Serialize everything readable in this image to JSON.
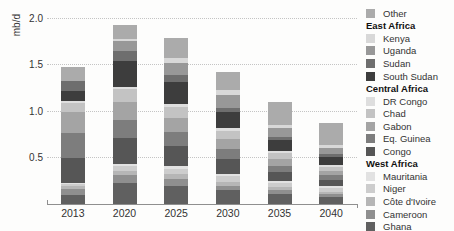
{
  "chart_data": {
    "type": "bar",
    "stacked": true,
    "title": "",
    "xlabel": "",
    "ylabel": "mb/d",
    "ylim": [
      0,
      2.0
    ],
    "yticks": [
      0.5,
      1.0,
      1.5,
      2.0
    ],
    "grid": "horizontal-dotted",
    "legend_position": "right",
    "axis_color": "#8f8f8f",
    "grid_color": "#c4c4c4",
    "text_color": "#333333",
    "categories": [
      "2013",
      "2020",
      "2025",
      "2030",
      "2035",
      "2040"
    ],
    "totals": [
      1.48,
      1.94,
      1.8,
      1.43,
      1.1,
      0.88
    ],
    "series": [
      {
        "name": "Ghana",
        "region": "West Africa",
        "color": "#606060",
        "values": [
          0.1,
          0.23,
          0.2,
          0.15,
          0.11,
          0.08
        ]
      },
      {
        "name": "Cameroon",
        "region": "West Africa",
        "color": "#8f8f8f",
        "values": [
          0.06,
          0.08,
          0.07,
          0.05,
          0.04,
          0.03
        ]
      },
      {
        "name": "Côte d'Ivoire",
        "region": "West Africa",
        "color": "#b6b6b6",
        "values": [
          0.04,
          0.05,
          0.05,
          0.04,
          0.03,
          0.02
        ]
      },
      {
        "name": "Niger",
        "region": "West Africa",
        "color": "#cdcdcd",
        "values": [
          0.02,
          0.05,
          0.06,
          0.06,
          0.05,
          0.04
        ]
      },
      {
        "name": "Mauritania",
        "region": "West Africa",
        "color": "#e2e2e2",
        "values": [
          0.01,
          0.02,
          0.03,
          0.03,
          0.02,
          0.02
        ]
      },
      {
        "name": "Congo",
        "region": "Central Africa",
        "color": "#565656",
        "values": [
          0.27,
          0.28,
          0.22,
          0.16,
          0.1,
          0.07
        ]
      },
      {
        "name": "Eq. Guinea",
        "region": "Central Africa",
        "color": "#7d7d7d",
        "values": [
          0.27,
          0.2,
          0.15,
          0.1,
          0.06,
          0.05
        ]
      },
      {
        "name": "Gabon",
        "region": "Central Africa",
        "color": "#a4a4a4",
        "values": [
          0.22,
          0.19,
          0.15,
          0.11,
          0.08,
          0.05
        ]
      },
      {
        "name": "Chad",
        "region": "Central Africa",
        "color": "#c3c3c3",
        "values": [
          0.1,
          0.14,
          0.12,
          0.09,
          0.06,
          0.04
        ]
      },
      {
        "name": "DR Congo",
        "region": "Central Africa",
        "color": "#dedede",
        "values": [
          0.02,
          0.03,
          0.03,
          0.03,
          0.02,
          0.02
        ]
      },
      {
        "name": "South Sudan",
        "region": "East Africa",
        "color": "#3d3d3d",
        "values": [
          0.11,
          0.28,
          0.24,
          0.17,
          0.12,
          0.09
        ]
      },
      {
        "name": "Sudan",
        "region": "East Africa",
        "color": "#6e6e6e",
        "values": [
          0.11,
          0.1,
          0.07,
          0.05,
          0.04,
          0.03
        ]
      },
      {
        "name": "Uganda",
        "region": "East Africa",
        "color": "#989898",
        "values": [
          0.0,
          0.11,
          0.14,
          0.14,
          0.09,
          0.07
        ]
      },
      {
        "name": "Kenya",
        "region": "East Africa",
        "color": "#d8d8d8",
        "values": [
          0.0,
          0.03,
          0.05,
          0.05,
          0.04,
          0.03
        ]
      },
      {
        "name": "Other",
        "region": "",
        "color": "#ababab",
        "values": [
          0.15,
          0.15,
          0.22,
          0.2,
          0.24,
          0.24
        ]
      }
    ],
    "legend": {
      "groups": [
        {
          "header": null,
          "items": [
            "Other"
          ]
        },
        {
          "header": "East Africa",
          "items": [
            "Kenya",
            "Uganda",
            "Sudan",
            "South Sudan"
          ]
        },
        {
          "header": "Central Africa",
          "items": [
            "DR Congo",
            "Chad",
            "Gabon",
            "Eq. Guinea",
            "Congo"
          ]
        },
        {
          "header": "West Africa",
          "items": [
            "Mauritania",
            "Niger",
            "Côte d'Ivoire",
            "Cameroon",
            "Ghana"
          ]
        }
      ]
    }
  }
}
